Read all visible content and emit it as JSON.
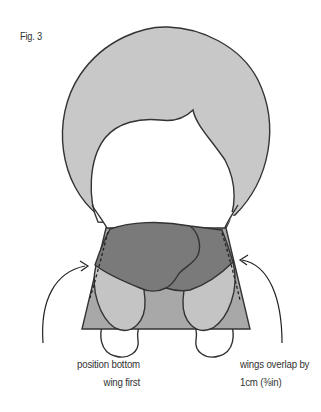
{
  "figure": {
    "label": "Fig. 3"
  },
  "annotations": {
    "left": {
      "line1": "position bottom",
      "line2": "wing first"
    },
    "right": {
      "line1": "wings overlap by",
      "line2": "1cm (⅜in)"
    }
  },
  "colors": {
    "outline": "#333333",
    "hair_light_grey": "#c8c8c8",
    "body_mid_grey": "#a8a8a8",
    "top_wing_dark_grey": "#7a7a7a",
    "bottom_wings_light_grey": "#c4c4c4",
    "face_white": "#ffffff"
  }
}
